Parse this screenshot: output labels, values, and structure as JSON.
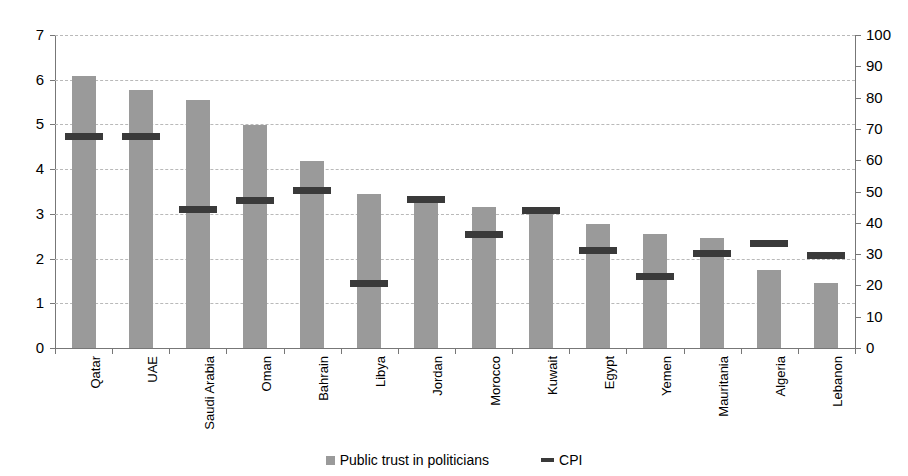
{
  "chart_data": {
    "type": "bar",
    "title": "",
    "title_cropped": true,
    "categories": [
      "Qatar",
      "UAE",
      "Saudi Arabia",
      "Oman",
      "Bahrain",
      "Libya",
      "Jordan",
      "Morocco",
      "Kuwait",
      "Egypt",
      "Yemen",
      "Mauritania",
      "Algeria",
      "Lebanon"
    ],
    "series": [
      {
        "name": "Public trust in politicians",
        "type": "bar",
        "axis": "left",
        "color": "#9a9a9a",
        "values": [
          6.08,
          5.78,
          5.55,
          4.98,
          4.18,
          3.45,
          3.32,
          3.15,
          3.08,
          2.78,
          2.55,
          2.45,
          1.75,
          1.45
        ]
      },
      {
        "name": "CPI",
        "type": "marker",
        "axis": "left_scaled",
        "color": "#3a3a3a",
        "values": [
          4.75,
          4.75,
          3.1,
          3.3,
          3.53,
          1.45,
          3.33,
          2.55,
          3.08,
          2.2,
          1.6,
          2.12,
          2.35,
          2.07
        ],
        "values_right_axis": [
          68,
          68,
          44,
          47,
          50,
          21,
          48,
          36,
          44,
          31,
          23,
          30,
          34,
          30
        ]
      }
    ],
    "xlabel": "",
    "ylabel_left": "",
    "ylabel_right": "",
    "ylim_left": [
      0,
      7
    ],
    "ylim_right": [
      0,
      100
    ],
    "yticks_left": [
      "0",
      "1",
      "2",
      "3",
      "4",
      "5",
      "6",
      "7"
    ],
    "yticks_right": [
      "0",
      "10",
      "20",
      "30",
      "40",
      "50",
      "60",
      "70",
      "80",
      "90",
      "100"
    ],
    "grid": true,
    "grid_style": "dashed",
    "legend_position": "bottom-center",
    "legend": [
      "Public trust in politicians",
      "CPI"
    ]
  },
  "legend": {
    "bar_label": "Public trust in politicians",
    "cpi_label": "CPI"
  },
  "colors": {
    "bar": "#9a9a9a",
    "cpi": "#3a3a3a",
    "grid": "#b9b9b9",
    "axis": "#777777",
    "background": "#ffffff"
  }
}
